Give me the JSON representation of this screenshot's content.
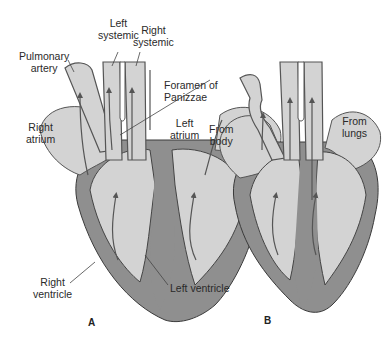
{
  "figure": {
    "colors": {
      "background": "#ffffff",
      "chamber_fill": "#d3d3d3",
      "wall_fill": "#8f8f8f",
      "outline": "#3a3a3a",
      "arrow": "#555555"
    },
    "panels": [
      {
        "id": "A",
        "letter": "A",
        "labels": {
          "left_systemic": "Left\nsystemic",
          "right_systemic": "Right\nsystemic",
          "pulmonary_artery": "Pulmonary\nartery",
          "foramen_of_panizzae": "Foramen of\nPanizzae",
          "right_atrium": "Right\natrium",
          "left_atrium": "Left\natrium",
          "right_ventricle": "Right\nventricle",
          "left_ventricle": "Left ventricle"
        }
      },
      {
        "id": "B",
        "letter": "B",
        "labels": {
          "from_body": "From\nbody",
          "from_lungs": "From\nlungs"
        }
      }
    ]
  }
}
